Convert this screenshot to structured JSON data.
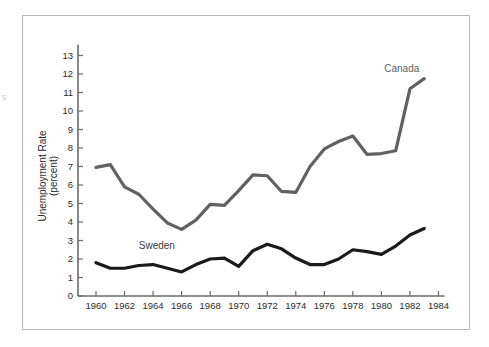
{
  "figure": {
    "edge_artifact": "s"
  },
  "chart_data": {
    "type": "line",
    "title": "",
    "xlabel": "",
    "ylabel": "Unemployment Rate (percent)",
    "ylabel_line1": "Unemployment Rate",
    "ylabel_line2": "(percent)",
    "xlim": [
      1959,
      1985
    ],
    "ylim": [
      0,
      13.6
    ],
    "grid": false,
    "legend_position": "inline-annotations",
    "xticks": [
      1960,
      1962,
      1964,
      1966,
      1968,
      1970,
      1972,
      1974,
      1976,
      1978,
      1980,
      1982,
      1984
    ],
    "xtick_labels": [
      "1960",
      "1962",
      "1964",
      "1966",
      "1968",
      "1970",
      "1972",
      "1974",
      "1976",
      "1978",
      "1980",
      "1982",
      "1984"
    ],
    "yticks": [
      0,
      1,
      2,
      3,
      4,
      5,
      6,
      7,
      8,
      9,
      10,
      11,
      12,
      13
    ],
    "ytick_labels": [
      "0",
      "1",
      "2",
      "3",
      "4",
      "5",
      "6",
      "7",
      "8",
      "9",
      "10",
      "11",
      "12",
      "13"
    ],
    "x": [
      1960,
      1961,
      1962,
      1963,
      1964,
      1965,
      1966,
      1967,
      1968,
      1969,
      1970,
      1971,
      1972,
      1973,
      1974,
      1975,
      1976,
      1977,
      1978,
      1979,
      1980,
      1981,
      1982,
      1983
    ],
    "series": [
      {
        "name": "Canada",
        "color": "#616161",
        "label_x": 1980.2,
        "label_y": 12.1,
        "values": [
          6.95,
          7.1,
          5.9,
          5.5,
          4.7,
          3.95,
          3.6,
          4.1,
          4.95,
          4.9,
          5.7,
          6.55,
          6.5,
          5.65,
          5.6,
          7.0,
          7.95,
          8.35,
          8.65,
          7.65,
          7.7,
          7.85,
          11.2,
          11.75
        ]
      },
      {
        "name": "Sweden",
        "color": "#1a1a1a",
        "label_x": 1963.0,
        "label_y": 2.55,
        "values": [
          1.8,
          1.5,
          1.5,
          1.65,
          1.7,
          1.5,
          1.3,
          1.7,
          2.0,
          2.05,
          1.6,
          2.45,
          2.8,
          2.55,
          2.05,
          1.7,
          1.7,
          2.0,
          2.5,
          2.4,
          2.25,
          2.7,
          3.3,
          3.65
        ]
      }
    ],
    "annotations": [
      {
        "text": "Canada",
        "x": 1980.2,
        "y": 12.1
      },
      {
        "text": "Sweden",
        "x": 1963.0,
        "y": 2.55
      }
    ]
  }
}
